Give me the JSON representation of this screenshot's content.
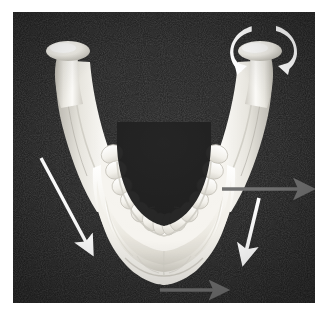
{
  "figure": {
    "background_color": "#1b1b1b",
    "bone_color": "#f2f1ec",
    "plate": {
      "x": 13,
      "y": 12,
      "width": 302,
      "height": 291
    },
    "caption": ""
  },
  "anatomy": {
    "parts": [
      {
        "name": "left-condyle",
        "label": "Condylar process (left)"
      },
      {
        "name": "right-condyle",
        "label": "Condylar process (right)"
      },
      {
        "name": "left-ramus",
        "label": "Ramus (left)"
      },
      {
        "name": "right-ramus",
        "label": "Ramus (right)"
      },
      {
        "name": "dental-arch",
        "label": "Mandibular dental arch"
      },
      {
        "name": "mandibular-body",
        "label": "Body of mandible"
      },
      {
        "name": "mentum",
        "label": "Chin / mental protuberance"
      }
    ],
    "tooth_count": 14
  },
  "markers": {
    "white_color": "#ffffff",
    "gray_color": "#6e6e6e",
    "arrows": [
      {
        "name": "left-downward-force-arrow",
        "style": "straight",
        "color": "#ffffff",
        "from": [
          28,
          146
        ],
        "to": [
          74,
          232
        ],
        "meaning": "downward-backward displacement vector, left side"
      },
      {
        "name": "right-downward-force-arrow",
        "style": "straight",
        "color": "#ffffff",
        "from": [
          246,
          186
        ],
        "to": [
          233,
          240
        ],
        "meaning": "downward displacement vector, right side"
      },
      {
        "name": "right-lateral-force-arrow",
        "style": "straight",
        "color": "#6e6e6e",
        "from": [
          209,
          177
        ],
        "to": [
          288,
          177
        ],
        "meaning": "lateral (outward) displacement vector at right molar region"
      },
      {
        "name": "chin-lateral-force-arrow",
        "style": "straight",
        "color": "#6e6e6e",
        "from": [
          147,
          278
        ],
        "to": [
          203,
          278
        ],
        "meaning": "lateral displacement vector at the chin"
      },
      {
        "name": "condyle-rotation-arrow-left",
        "style": "curved",
        "color": "#ffffff",
        "direction": "counter-clockwise",
        "meaning": "rotation of the right condyle, medial sweep"
      },
      {
        "name": "condyle-rotation-arrow-right",
        "style": "curved",
        "color": "#ffffff",
        "direction": "clockwise",
        "meaning": "rotation of the right condyle, lateral sweep"
      }
    ]
  }
}
